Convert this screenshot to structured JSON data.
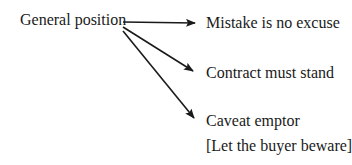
{
  "source": {
    "label": "General position"
  },
  "targets": [
    {
      "label": "Mistake is no excuse"
    },
    {
      "label": "Contract must stand"
    },
    {
      "label": "Caveat emptor",
      "sublabel": "[Let the buyer beware]"
    }
  ]
}
